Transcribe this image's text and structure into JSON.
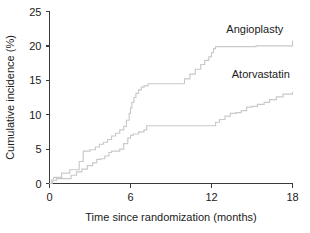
{
  "chart_data": {
    "type": "line",
    "title": "",
    "xlabel": "Time since randomization (months)",
    "ylabel": "Cumulative incidence (%)",
    "xlim": [
      0,
      18
    ],
    "ylim": [
      0,
      25
    ],
    "xticks": [
      0,
      6,
      12,
      18
    ],
    "yticks": [
      0,
      5,
      10,
      15,
      20,
      25
    ],
    "xtick_labels": [
      "0",
      "6",
      "12",
      "18"
    ],
    "ytick_labels": [
      "0",
      "5",
      "10",
      "15",
      "20",
      "25"
    ],
    "grid": false,
    "legend_position": "inline-annotations",
    "step_style": "post",
    "line_color": "#c9c9c9",
    "axis_color": "#3a3a3a",
    "series": [
      {
        "name": "Angioplasty",
        "label_x": 13.1,
        "label_y": 21.9,
        "x": [
          0.0,
          0.15,
          0.3,
          0.6,
          0.9,
          1.2,
          1.5,
          1.9,
          2.2,
          2.5,
          2.6,
          3.0,
          3.4,
          3.7,
          4.0,
          4.3,
          4.6,
          4.9,
          5.2,
          5.5,
          5.7,
          5.9,
          6.0,
          6.1,
          6.25,
          6.4,
          6.6,
          6.8,
          7.0,
          7.3,
          7.6,
          9.7,
          10.0,
          10.4,
          10.8,
          11.2,
          11.5,
          11.8,
          12.0,
          12.15,
          12.3,
          13.0,
          14.1,
          15.3,
          17.4,
          18.0
        ],
        "y": [
          0.0,
          0.5,
          0.9,
          0.9,
          1.5,
          1.5,
          2.0,
          2.0,
          3.2,
          4.7,
          4.7,
          4.9,
          5.3,
          5.7,
          6.0,
          6.4,
          6.9,
          7.3,
          7.8,
          8.3,
          9.2,
          10.2,
          11.0,
          11.8,
          12.5,
          13.1,
          13.6,
          14.0,
          14.2,
          14.5,
          14.5,
          14.5,
          15.2,
          15.9,
          16.6,
          17.3,
          17.9,
          18.4,
          19.0,
          19.6,
          19.9,
          19.9,
          19.9,
          20.0,
          20.0,
          20.8
        ]
      },
      {
        "name": "Atorvastatin",
        "label_x": 13.5,
        "label_y": 15.3,
        "x": [
          0.0,
          0.2,
          0.5,
          1.3,
          1.6,
          2.0,
          2.4,
          2.8,
          3.2,
          3.5,
          3.8,
          4.1,
          4.4,
          4.6,
          4.9,
          5.2,
          5.5,
          5.8,
          6.0,
          6.2,
          6.6,
          7.0,
          7.2,
          12.0,
          12.3,
          12.6,
          13.0,
          13.4,
          13.8,
          14.2,
          14.6,
          15.0,
          15.4,
          15.9,
          16.3,
          16.8,
          17.3,
          18.0
        ],
        "y": [
          0.0,
          0.4,
          0.7,
          0.7,
          1.2,
          1.7,
          2.1,
          2.6,
          3.0,
          3.5,
          3.6,
          4.0,
          4.5,
          4.7,
          4.7,
          5.0,
          5.8,
          6.6,
          7.0,
          7.2,
          7.5,
          7.8,
          8.4,
          8.4,
          8.9,
          9.3,
          9.8,
          10.2,
          10.3,
          10.6,
          11.1,
          11.2,
          11.5,
          11.8,
          12.2,
          12.6,
          13.0,
          13.3
        ]
      }
    ]
  }
}
